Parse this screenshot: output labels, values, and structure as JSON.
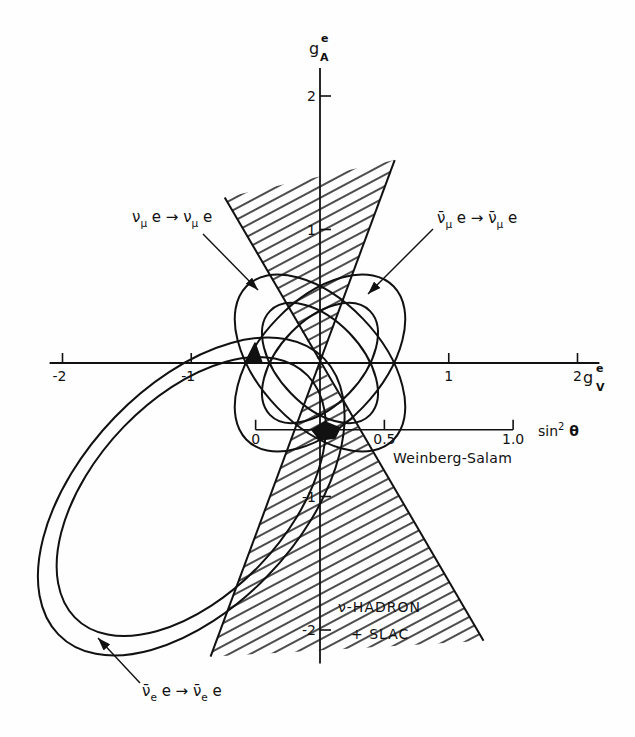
{
  "figure": {
    "y_axis_label": {
      "base": "g",
      "sub": "A",
      "sup": "e"
    },
    "x_axis_label": {
      "base": "g",
      "sub": "V",
      "sup": "e"
    },
    "secondary_axis_label": {
      "base": "sin",
      "sup": "2",
      "var": " θ"
    },
    "weinberg_salam_label": "Weinberg-Salam",
    "hadron_label_line1": "ν-HADRON",
    "hadron_label_line2": "+ SLAC",
    "reactions": {
      "numu": {
        "a": "ν",
        "a_sub": "μ",
        "mid": " e → ",
        "b": "ν",
        "b_sub": "μ",
        "end": " e"
      },
      "numubar": {
        "a": "ν̄",
        "a_sub": "μ",
        "mid": " e → ",
        "b": "ν̄",
        "b_sub": "μ",
        "end": " e"
      },
      "nuebar": {
        "a": "ν̄",
        "a_sub": "e",
        "mid": " e → ",
        "b": "ν̄",
        "b_sub": "e",
        "end": " e"
      }
    },
    "colors": {
      "ink": "#111111",
      "background": "#fefefe"
    }
  },
  "chart_data": {
    "type": "area",
    "title": "",
    "xlabel": "g_V^e",
    "ylabel": "g_A^e",
    "xlim": [
      -2.1,
      2.17
    ],
    "ylim": [
      -2.25,
      2.21
    ],
    "grid": false,
    "legend": null,
    "x_ticks": [
      {
        "value": -2,
        "label": "-2"
      },
      {
        "value": -1,
        "label": "-1"
      },
      {
        "value": 1,
        "label": "1"
      },
      {
        "value": 2,
        "label": "2"
      }
    ],
    "y_ticks": [
      {
        "value": 2,
        "label": "2"
      },
      {
        "value": 1,
        "label": "1"
      },
      {
        "value": -1,
        "label": "-1"
      },
      {
        "value": -2,
        "label": "-2"
      }
    ],
    "secondary_axis": {
      "label": "sin² θ",
      "curve_label": "Weinberg-Salam",
      "gA": -0.5,
      "gV_formula": "gV = -0.5 + 2·sin²θ",
      "ticks": [
        {
          "value": 0,
          "label": "0"
        },
        {
          "value": 0.5,
          "label": "0.5"
        },
        {
          "value": 1.0,
          "label": "1.0"
        }
      ]
    },
    "series": [
      {
        "name": "νμ e → νμ e",
        "shape": "elliptical ring",
        "center": [
          0,
          0
        ],
        "angle_deg": -45,
        "outer": [
          0.81,
          0.47
        ],
        "inner": [
          0.55,
          0.32
        ]
      },
      {
        "name": "ν̄μ e → ν̄μ e",
        "shape": "elliptical ring",
        "center": [
          0,
          0
        ],
        "angle_deg": 45,
        "outer": [
          0.81,
          0.47
        ],
        "inner": [
          0.55,
          0.32
        ]
      },
      {
        "name": "ν̄e e → ν̄e e",
        "shape": "elliptical ring",
        "center": [
          -1,
          -1
        ],
        "angle_deg": 45,
        "outer": [
          1.46,
          0.84
        ],
        "inner": [
          1.28,
          0.74
        ]
      },
      {
        "name": "ν-HADRON + SLAC",
        "shape": "hatched double cone",
        "upper": [
          [
            0,
            0
          ],
          [
            -0.74,
            1.24
          ],
          [
            0.58,
            1.52
          ]
        ],
        "lower": [
          [
            0,
            0
          ],
          [
            1.27,
            -2.08
          ],
          [
            -0.85,
            -2.2
          ]
        ],
        "edges": [
          [
            [
              -0.74,
              1.24
            ],
            [
              1.27,
              -2.08
            ]
          ],
          [
            [
              0.58,
              1.52
            ],
            [
              -0.85,
              -2.2
            ]
          ]
        ]
      }
    ],
    "solutions": [
      {
        "name": "solution-near-gV-minus-0.5",
        "polygon": [
          [
            -0.505,
            0.15
          ],
          [
            -0.583,
            0.0
          ],
          [
            -0.45,
            0.0
          ]
        ]
      },
      {
        "name": "solution-near-gA-minus-0.5",
        "polygon": [
          [
            -0.062,
            -0.502
          ],
          [
            0.039,
            -0.442
          ],
          [
            0.155,
            -0.487
          ],
          [
            0.117,
            -0.562
          ],
          [
            0.0,
            -0.577
          ]
        ]
      }
    ]
  }
}
